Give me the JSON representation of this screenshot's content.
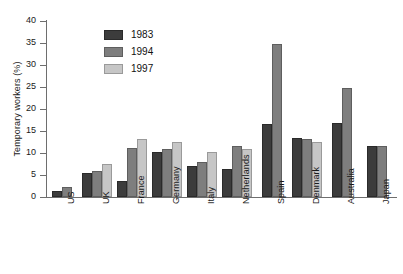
{
  "chart_data": {
    "type": "bar",
    "title": "",
    "xlabel": "",
    "ylabel": "Temporary workers (%)",
    "ylim": [
      0,
      40
    ],
    "yticks": [
      0,
      5,
      10,
      15,
      20,
      25,
      30,
      35,
      40
    ],
    "ytick_labels": [
      "0",
      "5",
      "10",
      "15",
      "20",
      "25",
      "30",
      "35",
      "40"
    ],
    "grid": false,
    "legend_position": "upper-left-inside",
    "categories": [
      "US",
      "UK",
      "France",
      "Germany",
      "Italy",
      "Netherlands",
      "Spain",
      "Denmark",
      "Australia",
      "Japan"
    ],
    "series": [
      {
        "name": "1983",
        "color": "#3c3c3c",
        "values": [
          1.3,
          5.5,
          3.6,
          10.3,
          7.1,
          6.4,
          16.5,
          13.5,
          16.9,
          11.6
        ]
      },
      {
        "name": "1994",
        "color": "#7e7e7e",
        "values": [
          2.3,
          6.0,
          11.2,
          10.9,
          7.9,
          11.6,
          34.7,
          13.2,
          24.8,
          11.7
        ]
      },
      {
        "name": "1997",
        "color": "#c6c6c6",
        "values": [
          null,
          7.5,
          13.2,
          12.4,
          10.2,
          11.0,
          null,
          12.4,
          null,
          null
        ]
      }
    ]
  },
  "legend": {
    "entries": [
      {
        "label": "1983"
      },
      {
        "label": "1994"
      },
      {
        "label": "1997"
      }
    ]
  },
  "colors": {
    "series_1983": "#3c3c3c",
    "series_1994": "#7e7e7e",
    "series_1997": "#c6c6c6",
    "axis": "#6e6e6e",
    "text": "#1a1a1a",
    "background": "#ffffff"
  }
}
